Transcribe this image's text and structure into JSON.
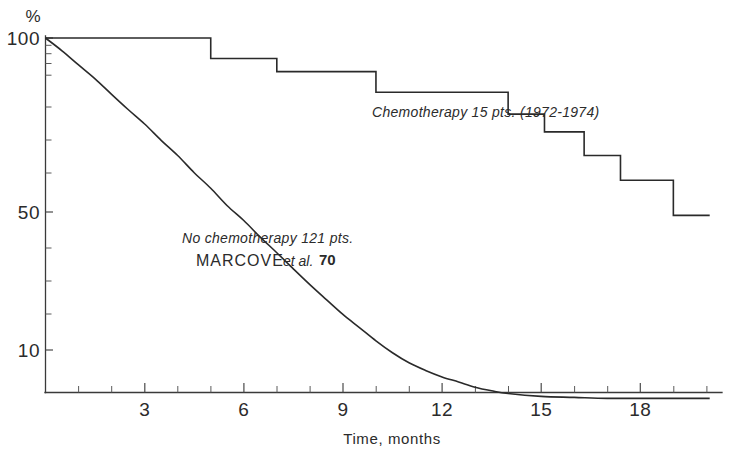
{
  "chart_data": {
    "type": "line",
    "title": "",
    "xlabel": "Time, months",
    "ylabel": "%",
    "yscale": "log",
    "ylim": [
      7,
      100
    ],
    "xlim": [
      0,
      20.1
    ],
    "grid": false,
    "legend_position": "inline-annotation",
    "y_tick_labels": [
      "100",
      "50",
      "10"
    ],
    "y_tick_values": [
      100,
      50,
      10
    ],
    "x_tick_labels": [
      "3",
      "6",
      "9",
      "12",
      "15",
      "18"
    ],
    "x_tick_values": [
      3,
      6,
      9,
      12,
      15,
      18
    ],
    "x_minor_tick_values": [
      1,
      2,
      4,
      5,
      7,
      8,
      10,
      11,
      13,
      14,
      16,
      17,
      19,
      20
    ],
    "series": [
      {
        "name": "Chemotherapy 15 pts. (1972-1974)",
        "style": "step",
        "n_patients": 15,
        "period": "1972-1974",
        "x": [
          0,
          5,
          5,
          7,
          7,
          10,
          10,
          14,
          14,
          15.1,
          15.1,
          16.3,
          16.3,
          17.4,
          17.4,
          19.0,
          19.0,
          20.1
        ],
        "y": [
          100,
          100,
          86,
          86,
          78,
          78,
          67,
          67,
          57,
          57,
          50,
          50,
          42,
          42,
          35,
          35,
          27,
          27
        ]
      },
      {
        "name": "No chemotherapy 121 pts.",
        "style": "smooth-exponential",
        "n_patients": 121,
        "source": "MARCOVE et al.",
        "reference_number": "70",
        "x": [
          0,
          0.5,
          1,
          1.5,
          2,
          2.5,
          3,
          3.5,
          4,
          4.5,
          5,
          5.5,
          6,
          6.5,
          7,
          7.5,
          8,
          8.5,
          9,
          9.5,
          10,
          10.5,
          11,
          11.5,
          12,
          12.5,
          13,
          13.5,
          14,
          15,
          16,
          17,
          18,
          19,
          20.1
        ],
        "y": [
          100,
          91,
          82,
          74,
          66,
          59,
          53,
          47,
          42,
          37,
          33,
          29,
          26,
          23,
          20.5,
          18.2,
          16.2,
          14.5,
          13.0,
          11.8,
          10.7,
          9.8,
          9.1,
          8.6,
          8.2,
          7.9,
          7.6,
          7.4,
          7.25,
          7.1,
          7.05,
          7.0,
          7.0,
          7.0,
          7.0
        ]
      }
    ],
    "annotations": [
      {
        "id": "chemo-label",
        "text": "Chemotherapy 15 pts. (1972-1974)",
        "x_px": 372,
        "y_px": 117
      },
      {
        "id": "nochemo-label-line1",
        "text": "No chemotherapy 121 pts.",
        "x_px": 182,
        "y_px": 243
      },
      {
        "id": "nochemo-label-line2-name",
        "text": "MARCOVE",
        "x_px": 196,
        "y_px": 266
      },
      {
        "id": "nochemo-label-line2-etal",
        "text": "et al.",
        "x_px": 283,
        "y_px": 266
      },
      {
        "id": "nochemo-label-line2-ref",
        "text": "70",
        "x_px": 319,
        "y_px": 265
      }
    ]
  },
  "axes": {
    "y_unit_symbol": "%",
    "y_labels": {
      "top": "100",
      "middle": "50",
      "bottom": "10"
    },
    "x_labels": {
      "t3": "3",
      "t6": "6",
      "t9": "9",
      "t12": "12",
      "t15": "15",
      "t18": "18"
    },
    "x_axis_title": "Time, months"
  },
  "colors": {
    "curve": "#2a2a2a",
    "axis": "#3a3a3a",
    "text": "#2b2b2b",
    "background": "#ffffff"
  }
}
